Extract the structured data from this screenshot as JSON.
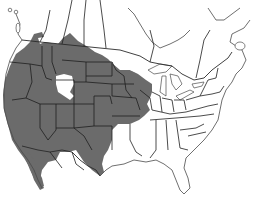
{
  "map": {
    "title": "",
    "region": "North America (United States, southern Canada, northern Mexico)",
    "style": "grayscale outline map with shaded range",
    "colors": {
      "background": "#ffffff",
      "range_fill": "#6b6b6b",
      "border_stroke": "#2a2a2a",
      "coast_stroke": "#4a4a4a"
    },
    "layers": [
      {
        "name": "shaded-range",
        "description": "Shaded distribution covering western and central North America from southern Canada to northern Mexico"
      },
      {
        "name": "state-province-borders",
        "description": "Political boundaries of US states, Canadian provinces and Mexican states"
      },
      {
        "name": "coastlines",
        "description": "Continental coastlines, Great Lakes, islands"
      }
    ],
    "unshaded_gaps": [
      {
        "name": "great-basin-gap",
        "description": "Unshaded area in Utah/Nevada interior"
      },
      {
        "name": "central-canada-gap",
        "description": "Unshaded area north of the range in central Canada"
      }
    ]
  }
}
